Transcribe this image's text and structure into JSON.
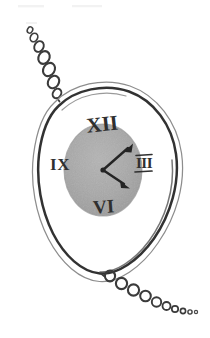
{
  "artwork": {
    "title": "Pocket Watch Sketch",
    "medium": "hand-drawn pencil sketch",
    "subject": "pocket watch with chain",
    "background_color": "#ffffff",
    "ink_color": "#3a3a3a",
    "ink_color_light": "#8d8d8d",
    "dial_fill_color": "#a9a9a9",
    "dial_edge_color": "#9a9a9a"
  },
  "watch": {
    "case_label": "watch case",
    "outer_outline_label": "outer case outline",
    "inner_outline_label": "inner case outline",
    "dial_label": "watch dial",
    "center_label": "hand pivot"
  },
  "dial": {
    "numerals": [
      {
        "id": "xii",
        "text": "XII",
        "position": "top",
        "x": 103,
        "y": 131,
        "size": 21,
        "rotate": -6
      },
      {
        "id": "iii",
        "text": "III",
        "position": "right",
        "x": 141,
        "y": 166,
        "size": 15,
        "rotate": 0
      },
      {
        "id": "vi",
        "text": "VI",
        "position": "bottom",
        "x": 103,
        "y": 209,
        "size": 19,
        "rotate": -4
      },
      {
        "id": "ix",
        "text": "IX",
        "position": "left",
        "x": 59,
        "y": 167,
        "size": 17,
        "rotate": 0
      }
    ],
    "iii_has_serif_bars": "true"
  },
  "hands": [
    {
      "id": "hour-hand",
      "label": "hour hand",
      "points_to": "IV",
      "angle_deg": 125,
      "length": 28
    },
    {
      "id": "minute-hand",
      "label": "minute hand",
      "points_to": "I",
      "angle_deg": 38,
      "length": 33
    }
  ],
  "chains": {
    "top": {
      "label": "upper watch chain",
      "links": [
        {
          "cx": 30,
          "cy": 30,
          "rx": 2.6,
          "ry": 3.2,
          "rot": 28
        },
        {
          "cx": 34,
          "cy": 37,
          "rx": 3.6,
          "ry": 4.4,
          "rot": 28
        },
        {
          "cx": 39,
          "cy": 46,
          "rx": 4.5,
          "ry": 5.6,
          "rot": 30
        },
        {
          "cx": 44,
          "cy": 57,
          "rx": 5.4,
          "ry": 6.6,
          "rot": 30
        },
        {
          "cx": 49,
          "cy": 69,
          "rx": 5.6,
          "ry": 7.0,
          "rot": 32
        },
        {
          "cx": 53,
          "cy": 82,
          "rx": 5.3,
          "ry": 6.6,
          "rot": 34
        },
        {
          "cx": 57,
          "cy": 93,
          "rx": 4.2,
          "ry": 5.2,
          "rot": 34
        }
      ]
    },
    "bottom": {
      "label": "lower watch chain",
      "links": [
        {
          "cx": 110,
          "cy": 275,
          "rx": 5.1,
          "ry": 5.4,
          "rot": 0
        },
        {
          "cx": 121,
          "cy": 283,
          "rx": 5.6,
          "ry": 5.6,
          "rot": 0
        },
        {
          "cx": 133,
          "cy": 290,
          "rx": 5.6,
          "ry": 5.6,
          "rot": 0
        },
        {
          "cx": 145,
          "cy": 296,
          "rx": 5.4,
          "ry": 5.4,
          "rot": 0
        },
        {
          "cx": 156,
          "cy": 302,
          "rx": 4.8,
          "ry": 4.8,
          "rot": 0
        },
        {
          "cx": 166,
          "cy": 306,
          "rx": 4.0,
          "ry": 4.0,
          "rot": 0
        },
        {
          "cx": 175,
          "cy": 309,
          "rx": 3.2,
          "ry": 3.2,
          "rot": 0
        },
        {
          "cx": 183,
          "cy": 311,
          "rx": 2.6,
          "ry": 2.6,
          "rot": 0
        },
        {
          "cx": 190,
          "cy": 312,
          "rx": 2.1,
          "ry": 2.1,
          "rot": 0
        },
        {
          "cx": 196,
          "cy": 312,
          "rx": 1.6,
          "ry": 1.6,
          "rot": 0
        }
      ]
    }
  },
  "canvas": {
    "width": 210,
    "height": 338
  }
}
